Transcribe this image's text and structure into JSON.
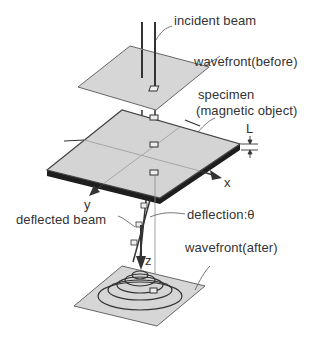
{
  "diagram": {
    "labels": {
      "incident_beam": "incident beam",
      "wavefront_before": "wavefront(before)",
      "specimen": "specimen",
      "magnetic_object": "(magnetic object)",
      "thickness": "L",
      "x_axis": "x",
      "y_axis": "y",
      "z_axis": "z",
      "deflection": "deflection:θ",
      "deflected_beam": "deflected beam",
      "wavefront_after": "wavefront(after)"
    },
    "colors": {
      "plane_fill": "#d6d6d6",
      "plane_stroke": "#555555",
      "specimen_edge": "#1e1e1e",
      "line": "#333333",
      "text": "#333333"
    }
  }
}
